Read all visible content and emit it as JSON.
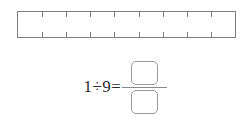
{
  "worksheet": {
    "model": {
      "label": "fraction-bar-model",
      "total_parts": 9,
      "shaded_parts": 0,
      "interior_tick_count": 8,
      "tick_positions_percent": [
        11.11,
        22.22,
        33.33,
        44.44,
        55.56,
        66.67,
        77.78,
        88.89
      ],
      "border_color": "#7d7d7d",
      "fill_color": "#ffffff"
    },
    "equation": {
      "expression": "1÷9=",
      "dividend": "1",
      "division_sign": "÷",
      "divisor": "9",
      "equals_sign": "=",
      "numerator_value": "",
      "denominator_value": "",
      "numerator_placeholder": "",
      "denominator_placeholder": "",
      "text_color": "#2b2b2b",
      "box_border_color": "#9a9a9a",
      "fraction_bar_color": "#8a8a8a"
    }
  }
}
